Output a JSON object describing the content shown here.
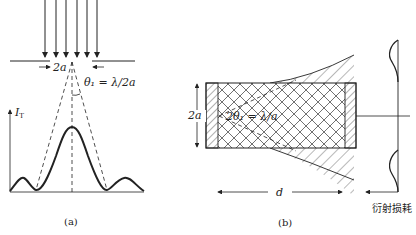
{
  "panel_a": {
    "caption": "(a)",
    "slit_width_label": "2a",
    "angle_label": "θ₁ = λ/2a",
    "axis_label": "I",
    "axis_label_sub": "T"
  },
  "panel_b": {
    "caption": "(b)",
    "height_label": "2a",
    "angle_label": "2θ₁ = λ/a",
    "length_label": "d",
    "loss_label": "衍射损耗"
  },
  "colors": {
    "ink": "#222222",
    "background": "#ffffff"
  }
}
